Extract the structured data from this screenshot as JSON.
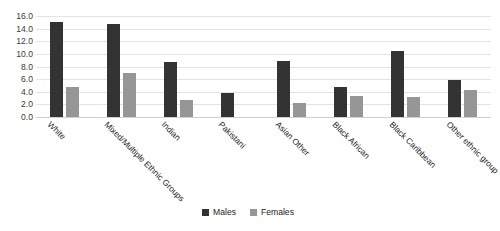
{
  "chart_data": {
    "type": "bar",
    "title": "",
    "xlabel": "",
    "ylabel": "",
    "ylim": [
      0,
      16
    ],
    "ytick_labels": [
      "16.0",
      "14.0",
      "12.0",
      "10.0",
      "8.0",
      "6.0",
      "4.0",
      "2.0",
      "0.0"
    ],
    "ytick_values": [
      16,
      14,
      12,
      10,
      8,
      6,
      4,
      2,
      0
    ],
    "grid": true,
    "legend_position": "bottom",
    "categories": [
      "White",
      "Mixed/Multiple Ethnic Groups",
      "Indian",
      "Pakistani",
      "Asian Other",
      "Black African",
      "Black Caribbean",
      "Other ethnic group"
    ],
    "series": [
      {
        "name": "Males",
        "color": "#333333",
        "values": [
          15.0,
          14.8,
          8.7,
          3.8,
          8.8,
          4.7,
          10.5,
          5.8
        ]
      },
      {
        "name": "Females",
        "color": "#969696",
        "values": [
          4.8,
          7.0,
          2.7,
          0.0,
          2.2,
          3.3,
          3.1,
          4.3
        ]
      }
    ]
  },
  "legend": {
    "items": [
      {
        "label": "Males",
        "color": "#333333"
      },
      {
        "label": "Females",
        "color": "#969696"
      }
    ]
  }
}
